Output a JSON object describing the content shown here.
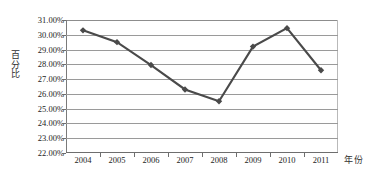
{
  "chart_data": {
    "type": "line",
    "title": "",
    "xlabel": "年份",
    "ylabel": "百分比",
    "categories": [
      "2004",
      "2005",
      "2006",
      "2007",
      "2008",
      "2009",
      "2010",
      "2011"
    ],
    "values": [
      30.3,
      29.5,
      27.95,
      26.3,
      25.5,
      29.2,
      30.45,
      27.6
    ],
    "series": [
      {
        "name": "百分比",
        "values": [
          30.3,
          29.5,
          27.95,
          26.3,
          25.5,
          29.2,
          30.45,
          27.6
        ]
      }
    ],
    "ylim": [
      22.0,
      31.0
    ],
    "ytick_values": [
      22.0,
      23.0,
      24.0,
      25.0,
      26.0,
      27.0,
      28.0,
      29.0,
      30.0,
      31.0
    ],
    "ytick_labels": [
      "22.00%",
      "23.00%",
      "24.00%",
      "25.00%",
      "26.00%",
      "27.00%",
      "28.00%",
      "29.00%",
      "30.00%",
      "31.00%"
    ],
    "grid": true,
    "grid_axis": "y",
    "legend": false,
    "legend_position": "none",
    "marker": "diamond",
    "line_color": "#4a4a4a",
    "marker_color": "#4a4a4a",
    "grid_color": "#9a9a9a",
    "axis_color": "#6e6e6e",
    "background_color": "#ffffff",
    "text_color": "#242424"
  }
}
